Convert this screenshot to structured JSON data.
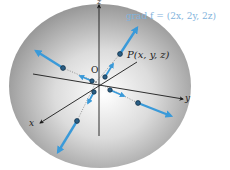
{
  "diagram": {
    "title_formula": "grad f = (2x, 2y, 2z)",
    "point_label": "P(x, y, z)",
    "origin_label": "O",
    "axes": {
      "x_label": "x",
      "y_label": "y",
      "z_label": "z"
    },
    "colors": {
      "arrow": "#3a9ad9",
      "axis": "#1a1a1a",
      "sphere_light": "#ffffff",
      "sphere_dark": "#8a8a8a",
      "formula": "#7fb3dc"
    },
    "shape": "sphere",
    "vector_count": 8
  }
}
